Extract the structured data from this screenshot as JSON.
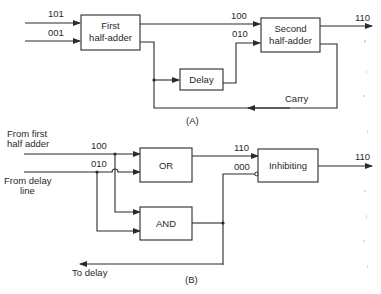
{
  "diagram_a": {
    "caption": "(A)",
    "inputs": [
      "101",
      "001"
    ],
    "first_half_adder": {
      "line1": "First",
      "line2": "half-adder"
    },
    "second_half_adder": {
      "line1": "Second",
      "line2": "half-adder"
    },
    "delay": "Delay",
    "sum_to_second": "100",
    "delayed_to_second": "010",
    "output": "110",
    "carry": "Carry"
  },
  "diagram_b": {
    "caption": "(B)",
    "input1_label": {
      "line1": "From first",
      "line2": "half adder"
    },
    "input2_label": {
      "line1": "From delay",
      "line2": "line"
    },
    "input1_value": "100",
    "input2_value": "010",
    "or_gate": "OR",
    "and_gate": "AND",
    "inhibiting": "Inhibiting",
    "or_output": "110",
    "and_output": "000",
    "output": "110",
    "to_delay": "To delay"
  },
  "colors": {
    "ink": "#2a2a2a",
    "background": "#ffffff"
  }
}
